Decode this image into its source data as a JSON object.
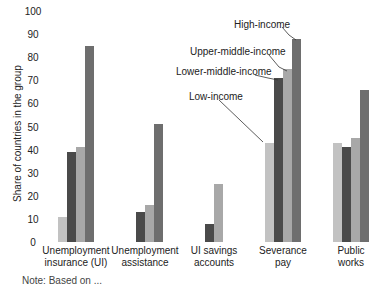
{
  "chart_data": {
    "type": "bar",
    "title": "",
    "xlabel": "",
    "ylabel": "Share of countries in the group",
    "ylim": [
      0,
      100
    ],
    "yticks": [
      0,
      10,
      20,
      30,
      40,
      50,
      60,
      70,
      80,
      90,
      100
    ],
    "grid": false,
    "legend_position": "inline annotations above Severance pay bars",
    "categories": [
      "Unemployment insurance (UI)",
      "Unemployment assistance",
      "UI savings accounts",
      "Severance pay",
      "Public works"
    ],
    "category_lines": [
      [
        "Unemployment",
        "insurance (UI)"
      ],
      [
        "Unemployment",
        "assistance"
      ],
      [
        "UI savings",
        "accounts"
      ],
      [
        "Severance",
        "pay"
      ],
      [
        "Public",
        "works"
      ]
    ],
    "series": [
      {
        "name": "Low-income",
        "color": "#c2c2c2",
        "values": [
          11,
          0,
          0,
          43,
          43
        ]
      },
      {
        "name": "Lower-middle-income",
        "color": "#4a4a4a",
        "values": [
          39,
          13,
          8,
          71,
          41
        ]
      },
      {
        "name": "Upper-middle-income",
        "color": "#a8a8a8",
        "values": [
          41,
          16,
          25,
          75,
          45
        ]
      },
      {
        "name": "High-income",
        "color": "#6e6e6e",
        "values": [
          85,
          51,
          0,
          88,
          66
        ]
      }
    ]
  },
  "annotations": {
    "high": "High-income",
    "upper_middle": "Upper-middle-income",
    "lower_middle": "Lower-middle-income",
    "low": "Low-income"
  },
  "note": "Note: Based on ..."
}
